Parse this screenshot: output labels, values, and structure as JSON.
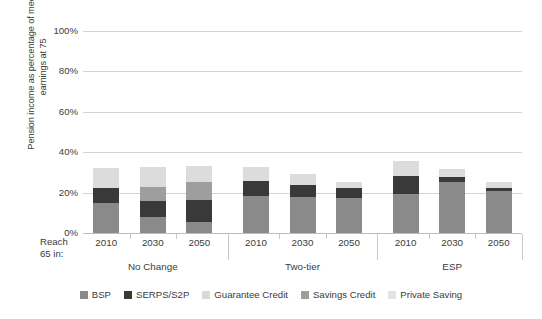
{
  "chart_data": {
    "type": "bar",
    "subtype": "stacked-bar-grouped",
    "title": "",
    "xlabel": "Reach 65 in:",
    "ylabel": "Pension income as percentage of median earnings at 75",
    "ylim": [
      0,
      100
    ],
    "yticks": [
      "0%",
      "20%",
      "40%",
      "60%",
      "80%",
      "100%"
    ],
    "ytick_values": [
      0,
      20,
      40,
      60,
      80,
      100
    ],
    "grid": true,
    "legend_position": "bottom",
    "groups": [
      "No Change",
      "Two-tier",
      "ESP"
    ],
    "categories": [
      "2010",
      "2030",
      "2050",
      "2010",
      "2030",
      "2050",
      "2010",
      "2030",
      "2050"
    ],
    "series": [
      {
        "name": "BSP",
        "color": "#8a8a8a",
        "values": [
          15.0,
          8.0,
          5.5,
          18.5,
          18.0,
          17.5,
          19.5,
          25.5,
          21.0
        ]
      },
      {
        "name": "SERPS/S2P",
        "color": "#393939",
        "values": [
          7.5,
          8.0,
          11.0,
          7.5,
          6.0,
          5.0,
          8.5,
          2.0,
          1.5
        ]
      },
      {
        "name": "Guarantee Credit",
        "color": "#d9d9d9",
        "values": [
          0.0,
          0.0,
          0.0,
          0.0,
          0.0,
          0.0,
          0.0,
          0.0,
          0.0
        ]
      },
      {
        "name": "Savings Credit",
        "color": "#9e9e9e",
        "values": [
          0.0,
          7.0,
          9.0,
          0.0,
          0.0,
          0.0,
          0.0,
          0.0,
          0.0
        ]
      },
      {
        "name": "Private Saving",
        "color": "#dcdcdc",
        "values": [
          9.5,
          9.5,
          7.5,
          6.5,
          5.0,
          3.0,
          7.5,
          4.0,
          3.0
        ]
      }
    ],
    "totals": [
      32.0,
      32.5,
      33.0,
      32.5,
      29.0,
      25.5,
      35.5,
      31.5,
      25.5
    ]
  },
  "axis": {
    "reach_label_line1": "Reach",
    "reach_label_line2": "65 in:"
  },
  "legend": {
    "items": [
      {
        "label": "BSP",
        "color": "#8a8a8a"
      },
      {
        "label": "SERPS/S2P",
        "color": "#393939"
      },
      {
        "label": "Guarantee Credit",
        "color": "#d9d9d9"
      },
      {
        "label": "Savings Credit",
        "color": "#9e9e9e"
      },
      {
        "label": "Private Saving",
        "color": "#e4e4e4"
      }
    ]
  }
}
